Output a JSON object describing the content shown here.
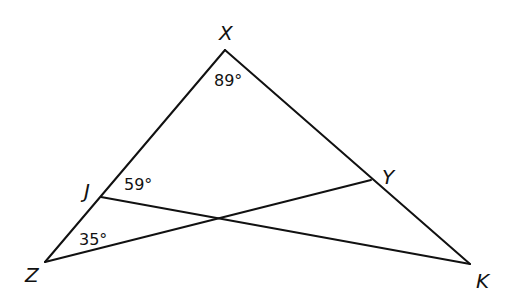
{
  "diagram": {
    "type": "triangle-geometry",
    "points": {
      "X": {
        "label": "X",
        "x": 225,
        "y": 50
      },
      "Z": {
        "label": "Z",
        "x": 45,
        "y": 262
      },
      "K": {
        "label": "K",
        "x": 470,
        "y": 264
      },
      "J": {
        "label": "J",
        "x": 101,
        "y": 197
      },
      "Y": {
        "label": "Y",
        "x": 371,
        "y": 180
      }
    },
    "segments": [
      [
        "X",
        "Z"
      ],
      [
        "X",
        "K"
      ],
      [
        "Z",
        "Y"
      ],
      [
        "J",
        "K"
      ]
    ],
    "angles": {
      "at_X": "89°",
      "at_J": "59°",
      "at_Z": "35°"
    },
    "stroke_color": "#111111",
    "background": "#ffffff"
  }
}
